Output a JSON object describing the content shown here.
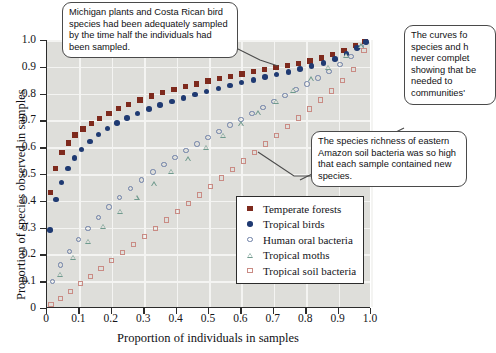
{
  "chart_data": {
    "type": "scatter",
    "title": "",
    "xlabel": "Proportion of individuals in samples",
    "ylabel": "Proportion of species observed in samples",
    "xlim": [
      0,
      1.0
    ],
    "ylim": [
      0,
      1.0
    ],
    "xticks": [
      "0",
      "0.1",
      "0.2",
      "0.3",
      "0.4",
      "0.5",
      "0.6",
      "0.7",
      "0.8",
      "0.9",
      "1.0"
    ],
    "yticks": [
      "0",
      "0.1",
      "0.2",
      "0.3",
      "0.4",
      "0.5",
      "0.6",
      "0.7",
      "0.8",
      "0.9",
      "1.0"
    ],
    "grid": true,
    "legend_position": "lower-right-inside",
    "series": [
      {
        "name": "Temperate forests",
        "marker": "filled-square",
        "color": "#7e2a1d",
        "x": [
          0.015,
          0.03,
          0.05,
          0.07,
          0.09,
          0.115,
          0.14,
          0.165,
          0.195,
          0.225,
          0.255,
          0.29,
          0.325,
          0.36,
          0.395,
          0.43,
          0.465,
          0.5,
          0.535,
          0.57,
          0.605,
          0.64,
          0.675,
          0.71,
          0.745,
          0.78,
          0.815,
          0.85,
          0.885,
          0.92,
          0.955,
          0.985
        ],
        "y": [
          0.43,
          0.52,
          0.58,
          0.615,
          0.645,
          0.667,
          0.688,
          0.707,
          0.726,
          0.745,
          0.76,
          0.776,
          0.79,
          0.803,
          0.815,
          0.826,
          0.836,
          0.846,
          0.855,
          0.864,
          0.873,
          0.881,
          0.889,
          0.897,
          0.905,
          0.913,
          0.921,
          0.932,
          0.945,
          0.96,
          0.978,
          0.995
        ]
      },
      {
        "name": "Tropical birds",
        "marker": "filled-circle",
        "color": "#1f3a72",
        "x": [
          0.013,
          0.03,
          0.048,
          0.067,
          0.088,
          0.11,
          0.135,
          0.162,
          0.19,
          0.22,
          0.25,
          0.283,
          0.317,
          0.352,
          0.388,
          0.424,
          0.46,
          0.496,
          0.532,
          0.568,
          0.604,
          0.64,
          0.676,
          0.712,
          0.748,
          0.784,
          0.82,
          0.856,
          0.892,
          0.928,
          0.96,
          0.988
        ],
        "y": [
          0.29,
          0.405,
          0.468,
          0.52,
          0.56,
          0.592,
          0.622,
          0.648,
          0.67,
          0.69,
          0.708,
          0.726,
          0.742,
          0.757,
          0.771,
          0.784,
          0.796,
          0.808,
          0.819,
          0.83,
          0.841,
          0.851,
          0.861,
          0.871,
          0.881,
          0.891,
          0.902,
          0.915,
          0.93,
          0.948,
          0.97,
          0.993
        ]
      },
      {
        "name": "Human oral bacteria",
        "marker": "open-circle",
        "color": "#6d7fa6",
        "x": [
          0.02,
          0.045,
          0.072,
          0.1,
          0.13,
          0.162,
          0.195,
          0.228,
          0.262,
          0.296,
          0.33,
          0.364,
          0.398,
          0.432,
          0.466,
          0.5,
          0.534,
          0.568,
          0.602,
          0.636,
          0.67,
          0.704,
          0.738,
          0.772,
          0.806,
          0.84,
          0.874,
          0.908,
          0.942,
          0.975
        ],
        "y": [
          0.098,
          0.16,
          0.21,
          0.255,
          0.297,
          0.338,
          0.377,
          0.412,
          0.445,
          0.477,
          0.507,
          0.535,
          0.562,
          0.588,
          0.612,
          0.636,
          0.659,
          0.682,
          0.704,
          0.726,
          0.748,
          0.77,
          0.792,
          0.814,
          0.836,
          0.858,
          0.882,
          0.908,
          0.938,
          0.975
        ]
      },
      {
        "name": "Tropical moths",
        "marker": "open-triangle",
        "color": "#6f9a8d",
        "x": [
          0.045,
          0.085,
          0.13,
          0.178,
          0.228,
          0.28,
          0.333,
          0.386,
          0.44,
          0.494,
          0.548,
          0.602,
          0.656,
          0.71,
          0.764,
          0.818,
          0.872,
          0.926,
          0.972
        ],
        "y": [
          0.125,
          0.188,
          0.248,
          0.305,
          0.36,
          0.412,
          0.462,
          0.51,
          0.556,
          0.6,
          0.643,
          0.686,
          0.728,
          0.77,
          0.812,
          0.855,
          0.898,
          0.942,
          0.978
        ]
      },
      {
        "name": "Tropical soil bacteria",
        "marker": "open-square",
        "color": "#c98b84",
        "x": [
          0.016,
          0.045,
          0.075,
          0.106,
          0.138,
          0.17,
          0.203,
          0.236,
          0.27,
          0.304,
          0.338,
          0.372,
          0.406,
          0.44,
          0.474,
          0.508,
          0.542,
          0.576,
          0.61,
          0.644,
          0.678,
          0.712,
          0.746,
          0.78,
          0.814,
          0.848,
          0.882,
          0.916,
          0.95,
          0.982
        ],
        "y": [
          0.012,
          0.036,
          0.062,
          0.09,
          0.118,
          0.147,
          0.176,
          0.206,
          0.236,
          0.266,
          0.297,
          0.328,
          0.359,
          0.39,
          0.421,
          0.452,
          0.484,
          0.516,
          0.548,
          0.58,
          0.612,
          0.644,
          0.676,
          0.709,
          0.742,
          0.776,
          0.81,
          0.848,
          0.89,
          0.96
        ]
      }
    ],
    "annotations": [
      {
        "id": "callout-top-left",
        "text": "Michigan plants and Costa Rican bird species had been adequately sampled by the time half the individuals had been sampled."
      },
      {
        "id": "callout-top-right",
        "text": "The curves fo species and h never complet showing that be needed to communities'"
      },
      {
        "id": "callout-bottom-right",
        "text": "The species richness of eastern Amazon soil bacteria was so high that each sample contained new species."
      }
    ]
  },
  "legend": {
    "items": [
      {
        "label": "Temperate forests",
        "marker": "filled-square",
        "color": "#7e2a1d"
      },
      {
        "label": "Tropical birds",
        "marker": "filled-circle",
        "color": "#1f3a72"
      },
      {
        "label": "Human oral bacteria",
        "marker": "open-circle",
        "color": "#6d7fa6"
      },
      {
        "label": "Tropical moths",
        "marker": "open-triangle",
        "color": "#6f9a8d"
      },
      {
        "label": "Tropical soil bacteria",
        "marker": "open-square",
        "color": "#c98b84"
      }
    ]
  }
}
